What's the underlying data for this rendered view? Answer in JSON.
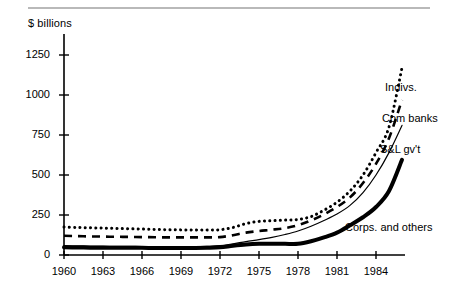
{
  "figure": {
    "name": "consumer-credit-holders-chart",
    "has_top_rule": true,
    "axis_title": "$ billions"
  },
  "chart_data": {
    "type": "line",
    "title": "",
    "subtitle": "",
    "xlabel": "",
    "ylabel": "$ billions",
    "grid": false,
    "legend_position": "inline-right",
    "xlim": [
      1960,
      1986
    ],
    "ylim": [
      0,
      1375
    ],
    "yticks": [
      0,
      250,
      500,
      750,
      1000,
      1250
    ],
    "ytick_labels": [
      "0",
      "250",
      "500",
      "750",
      "1000",
      "1250"
    ],
    "xticks": [
      1960,
      1963,
      1966,
      1969,
      1972,
      1975,
      1978,
      1981,
      1984
    ],
    "xtick_labels": [
      "1960",
      "1963",
      "1966",
      "1969",
      "1972",
      "1975",
      "1978",
      "1981",
      "1984"
    ],
    "x": [
      1960,
      1961,
      1962,
      1963,
      1964,
      1965,
      1966,
      1967,
      1968,
      1969,
      1970,
      1971,
      1972,
      1973,
      1974,
      1975,
      1976,
      1977,
      1978,
      1979,
      1980,
      1981,
      1982,
      1983,
      1984,
      1985,
      1986
    ],
    "series": [
      {
        "name": "Indivs.",
        "label": "Indivs.",
        "style": "dotted",
        "color": "#000000",
        "width": 3,
        "values": [
          175,
          172,
          170,
          168,
          166,
          164,
          162,
          160,
          158,
          157,
          156,
          156,
          158,
          172,
          196,
          210,
          214,
          218,
          222,
          240,
          280,
          330,
          400,
          500,
          640,
          800,
          1170
        ]
      },
      {
        "name": "Com banks",
        "label": "Com banks",
        "style": "dashed",
        "color": "#000000",
        "width": 2.6,
        "values": [
          120,
          118,
          116,
          115,
          114,
          113,
          112,
          111,
          110,
          110,
          110,
          110,
          112,
          124,
          140,
          150,
          158,
          168,
          186,
          216,
          254,
          300,
          360,
          450,
          570,
          730,
          970
        ]
      },
      {
        "name": "S&L gv't",
        "label": "S&L gv't",
        "style": "solid-thin",
        "color": "#000000",
        "width": 1.2,
        "values": [
          58,
          57,
          56,
          55,
          54,
          54,
          53,
          53,
          52,
          52,
          52,
          54,
          58,
          70,
          84,
          96,
          110,
          128,
          150,
          180,
          216,
          256,
          310,
          390,
          500,
          640,
          810
        ]
      },
      {
        "name": "Corps. and others",
        "label": "Corps. and others",
        "style": "solid-thick",
        "color": "#000000",
        "width": 4,
        "values": [
          48,
          47,
          46,
          46,
          45,
          45,
          45,
          44,
          44,
          44,
          44,
          45,
          48,
          58,
          66,
          70,
          70,
          70,
          70,
          86,
          110,
          140,
          186,
          236,
          300,
          400,
          595
        ]
      }
    ],
    "annotations": [
      {
        "text": "Indivs.",
        "x_px": 385,
        "y_px": 88
      },
      {
        "text": "Com banks",
        "x_px": 382,
        "y_px": 119
      },
      {
        "text": "S&L gv't",
        "x_px": 380,
        "y_px": 150
      },
      {
        "text": "Corps. and others",
        "x_px": 345,
        "y_px": 228
      }
    ]
  }
}
